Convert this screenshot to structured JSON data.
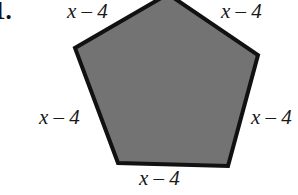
{
  "figure": {
    "problem_number": "1.",
    "shape_name": "pentagon",
    "fill_color": "#737373",
    "stroke_color": "#111111",
    "background_color": "#ffffff",
    "vertices": [
      [
        168,
        -6
      ],
      [
        258,
        55
      ],
      [
        228,
        166
      ],
      [
        118,
        163
      ],
      [
        75,
        48
      ]
    ],
    "labels": {
      "top_left": "x – 4",
      "top_right": "x – 4",
      "left": "x – 4",
      "right": "x – 4",
      "bottom": "x – 4"
    }
  }
}
